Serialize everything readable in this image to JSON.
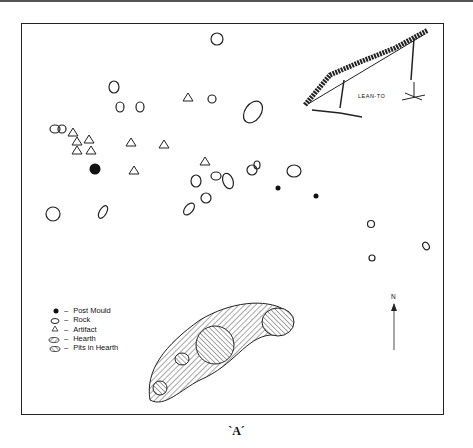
{
  "figure": {
    "caption": "`A´",
    "lean_to_label": "LEAN-TO",
    "north_label": "N"
  },
  "legend": {
    "items": [
      {
        "symbol": "filled-circle",
        "label": "Post Mould"
      },
      {
        "symbol": "rock-outline",
        "label": "Rock"
      },
      {
        "symbol": "triangle",
        "label": "Artifact"
      },
      {
        "symbol": "hatched-ellipse",
        "label": "Hearth"
      },
      {
        "symbol": "crosshatched-ellipse",
        "label": "Pits in Hearth"
      }
    ]
  }
}
